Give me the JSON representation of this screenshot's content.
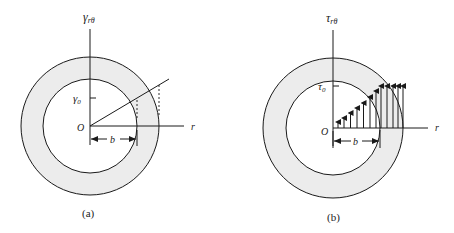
{
  "figure": {
    "panels": [
      {
        "id": "a",
        "caption": "(a)",
        "axis_label_main": "γ",
        "axis_label_sub": "rθ",
        "tick_label_main": "γ",
        "tick_label_sub": "0",
        "origin_label": "O",
        "radial_axis_label": "r",
        "dimension_label": "b",
        "description": "Shear strain distribution: linear with radius through the tube wall"
      },
      {
        "id": "b",
        "caption": "(b)",
        "axis_label_main": "τ",
        "axis_label_sub": "rθ",
        "tick_label_main": "τ",
        "tick_label_sub": "0",
        "origin_label": "O",
        "radial_axis_label": "r",
        "dimension_label": "b",
        "description": "Shear stress distribution: linear up to r = b, then constant τ0 (elastic–plastic)"
      }
    ],
    "colors": {
      "line": "#1a1a1a",
      "annulus_fill": "#ececec",
      "background": "#ffffff"
    }
  }
}
